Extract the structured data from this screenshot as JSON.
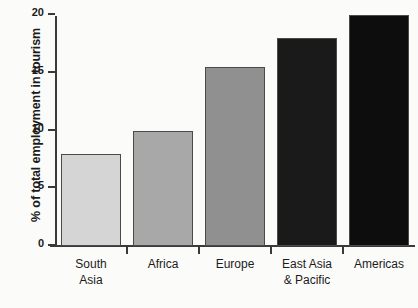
{
  "chart_data": {
    "type": "bar",
    "title": "",
    "xlabel": "",
    "ylabel": "% of total employment in tourism",
    "categories": [
      "South Asia",
      "Africa",
      "Europe",
      "East Asia & Pacific",
      "Americas"
    ],
    "category_lines": [
      [
        "South",
        "Asia"
      ],
      [
        "Africa",
        ""
      ],
      [
        "Europe",
        ""
      ],
      [
        "East Asia",
        "& Pacific"
      ],
      [
        "Americas",
        ""
      ]
    ],
    "values": [
      8,
      10,
      15.5,
      18,
      20
    ],
    "bar_colors": [
      "#d5d5d5",
      "#a8a8a8",
      "#909090",
      "#1a1a1a",
      "#0d0d0d"
    ],
    "bar_border_color": "#4a4a4a",
    "ylim": [
      0,
      20
    ],
    "yticks": [
      0,
      5,
      10,
      15,
      20
    ],
    "ytick_labels": [
      "0",
      "5",
      "10",
      "15",
      "20"
    ],
    "grid": false,
    "legend": null,
    "axis_color": "#3a3a3a",
    "background_color": "#fbfbfa"
  }
}
